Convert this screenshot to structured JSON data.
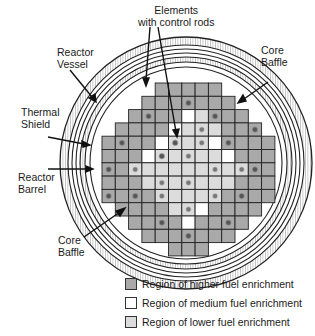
{
  "labels": {
    "elements_with_control_rods": [
      "Elements",
      "with control rods"
    ],
    "reactor_vessel": [
      "Reactor",
      "Vessel"
    ],
    "thermal_shield": [
      "Thermal",
      "Shield"
    ],
    "reactor_barrel": [
      "Reactor",
      "Barrel"
    ],
    "core_baffle_right": [
      "Core",
      "Baffle"
    ],
    "core_baffle_left": [
      "Core",
      "Baffle"
    ]
  },
  "legend": [
    {
      "label": "Region of higher fuel enrichment",
      "color": "#a9a9a9"
    },
    {
      "label": "Region of medium fuel enrichment",
      "color": "#ffffff"
    },
    {
      "label": "Region of lower fuel enrichment",
      "color": "#dcdcdc"
    }
  ],
  "colors": {
    "higher": "#a9a9a9",
    "medium": "#ffffff",
    "lower": "#dcdcdc",
    "rod_dark": "#555555",
    "grid_line": "#222222"
  },
  "core": {
    "cell_size": 13.3,
    "origin": [
      102,
      83
    ],
    "rows": [
      {
        "row": 0,
        "cols": [
          4,
          8
        ]
      },
      {
        "row": 1,
        "cols": [
          3,
          9
        ]
      },
      {
        "row": 2,
        "cols": [
          2,
          10
        ]
      },
      {
        "row": 3,
        "cols": [
          1,
          11
        ]
      },
      {
        "row": 4,
        "cols": [
          0,
          12
        ]
      },
      {
        "row": 5,
        "cols": [
          0,
          12
        ]
      },
      {
        "row": 6,
        "cols": [
          0,
          12
        ]
      },
      {
        "row": 7,
        "cols": [
          0,
          12
        ]
      },
      {
        "row": 8,
        "cols": [
          0,
          12
        ]
      },
      {
        "row": 9,
        "cols": [
          1,
          11
        ]
      },
      {
        "row": 10,
        "cols": [
          2,
          10
        ]
      },
      {
        "row": 11,
        "cols": [
          3,
          9
        ]
      },
      {
        "row": 12,
        "cols": [
          5,
          7
        ]
      }
    ],
    "medium_cells": [
      [
        2,
        6
      ],
      [
        3,
        5
      ],
      [
        4,
        4
      ],
      [
        4,
        8
      ],
      [
        5,
        3
      ],
      [
        5,
        9
      ],
      [
        9,
        7
      ],
      [
        10,
        6
      ]
    ],
    "lower_cells": [
      [
        3,
        6
      ],
      [
        3,
        7
      ],
      [
        4,
        5
      ],
      [
        4,
        6
      ],
      [
        4,
        7
      ],
      [
        5,
        4
      ],
      [
        5,
        5
      ],
      [
        5,
        6
      ],
      [
        5,
        7
      ],
      [
        5,
        8
      ],
      [
        6,
        3
      ],
      [
        6,
        4
      ],
      [
        6,
        5
      ],
      [
        6,
        6
      ],
      [
        6,
        7
      ],
      [
        6,
        8
      ],
      [
        6,
        9
      ],
      [
        7,
        3
      ],
      [
        7,
        4
      ],
      [
        7,
        5
      ],
      [
        7,
        6
      ],
      [
        7,
        7
      ],
      [
        7,
        8
      ],
      [
        7,
        9
      ],
      [
        8,
        4
      ],
      [
        8,
        5
      ],
      [
        8,
        6
      ],
      [
        8,
        7
      ],
      [
        8,
        8
      ],
      [
        9,
        5
      ],
      [
        9,
        6
      ],
      [
        2,
        7
      ],
      [
        6,
        2
      ],
      [
        6,
        10
      ],
      [
        3,
        8
      ]
    ],
    "control_rods": [
      [
        1,
        6
      ],
      [
        2,
        3
      ],
      [
        2,
        8
      ],
      [
        3,
        11
      ],
      [
        4,
        1
      ],
      [
        4,
        5
      ],
      [
        4,
        9
      ],
      [
        5,
        4
      ],
      [
        6,
        0
      ],
      [
        6,
        11
      ],
      [
        8,
        0
      ],
      [
        8,
        2
      ],
      [
        8,
        10
      ],
      [
        10,
        4
      ],
      [
        10,
        9
      ],
      [
        11,
        6
      ]
    ],
    "control_rods_light": [
      [
        3,
        7
      ],
      [
        4,
        7
      ],
      [
        5,
        6
      ],
      [
        6,
        2
      ],
      [
        6,
        8
      ],
      [
        6,
        10
      ],
      [
        7,
        4
      ],
      [
        7,
        6
      ],
      [
        8,
        4
      ],
      [
        8,
        8
      ],
      [
        9,
        6
      ]
    ]
  }
}
